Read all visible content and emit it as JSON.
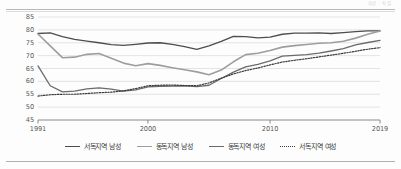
{
  "header": {
    "note": "자료 : 독일"
  },
  "chart_data": {
    "type": "line",
    "title": "",
    "subtitle": "",
    "xlabel": "",
    "ylabel": "",
    "xlim": [
      1991,
      2019
    ],
    "ylim": [
      45,
      85
    ],
    "grid": true,
    "grid_axis": "y",
    "legend_position": "bottom",
    "x": [
      1991,
      1992,
      1993,
      1994,
      1995,
      1996,
      1997,
      1998,
      1999,
      2000,
      2001,
      2002,
      2003,
      2004,
      2005,
      2006,
      2007,
      2008,
      2009,
      2010,
      2011,
      2012,
      2013,
      2014,
      2015,
      2016,
      2017,
      2018,
      2019
    ],
    "xticks": [
      1991,
      2000,
      2010,
      2019
    ],
    "xtick_labels": [
      "1991",
      "2000",
      "2010",
      "2019"
    ],
    "yticks": [
      45,
      50,
      55,
      60,
      65,
      70,
      75,
      80,
      85
    ],
    "ytick_labels": [
      "45",
      "50",
      "55",
      "60",
      "65",
      "70",
      "75",
      "80",
      "85"
    ],
    "series": [
      {
        "name": "서독지역 남성",
        "color": "#4d4d4d",
        "style": "solid",
        "width": 1.3,
        "values": [
          78.6,
          78.8,
          77.4,
          76.3,
          75.6,
          75.0,
          74.3,
          74.0,
          74.4,
          74.9,
          75.0,
          74.4,
          73.5,
          72.4,
          73.8,
          75.5,
          77.5,
          77.4,
          76.9,
          77.2,
          78.3,
          78.7,
          78.7,
          78.8,
          78.6,
          78.9,
          79.3,
          79.6,
          79.6
        ]
      },
      {
        "name": "동독지역 남성",
        "color": "#9e9e9e",
        "style": "solid",
        "width": 1.6,
        "values": [
          78.4,
          73.8,
          69.2,
          69.4,
          70.5,
          70.8,
          69.0,
          67.1,
          66.1,
          66.9,
          66.2,
          65.3,
          64.5,
          63.7,
          62.6,
          64.4,
          67.6,
          70.4,
          70.9,
          72.0,
          73.3,
          73.9,
          74.3,
          74.8,
          75.0,
          75.6,
          76.8,
          78.3,
          79.6
        ]
      },
      {
        "name": "동독지역 여성",
        "color": "#6b6b6b",
        "style": "solid",
        "width": 1.3,
        "values": [
          66.0,
          58.3,
          55.9,
          56.2,
          57.1,
          57.5,
          57.0,
          56.2,
          56.7,
          57.9,
          58.1,
          58.2,
          58.3,
          58.0,
          58.5,
          61.1,
          63.6,
          65.6,
          66.6,
          68.0,
          69.8,
          70.1,
          70.4,
          71.0,
          71.8,
          72.7,
          74.2,
          75.1,
          75.9
        ]
      },
      {
        "name": "서독지역 여성",
        "color": "#3a3a3a",
        "style": "dotted",
        "width": 1.2,
        "values": [
          54.3,
          54.8,
          55.0,
          55.0,
          55.3,
          55.6,
          55.8,
          56.3,
          57.2,
          58.3,
          58.5,
          58.6,
          58.4,
          58.3,
          59.4,
          61.2,
          62.9,
          64.2,
          65.2,
          66.4,
          67.5,
          68.2,
          68.8,
          69.5,
          70.2,
          70.9,
          71.7,
          72.5,
          73.1
        ]
      }
    ]
  }
}
